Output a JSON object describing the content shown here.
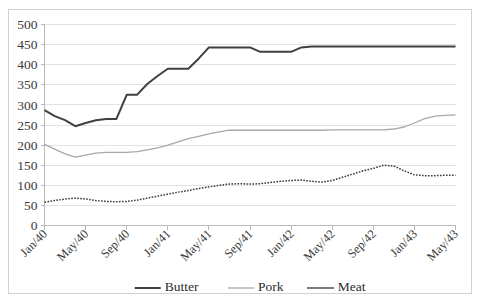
{
  "chart_data": {
    "type": "line",
    "title": "",
    "xlabel": "",
    "ylabel": "",
    "ylim": [
      0,
      500
    ],
    "ytick_step": 50,
    "ytick_labels": [
      "0",
      "50",
      "100",
      "150",
      "200",
      "250",
      "300",
      "350",
      "400",
      "450",
      "500"
    ],
    "grid": true,
    "legend_position": "bottom",
    "x_tick_labels": [
      "Jan/40",
      "May/40",
      "Sep/40",
      "Jan/41",
      "May/41",
      "Sep/41",
      "Jan/42",
      "May/42",
      "Sep/42",
      "Jan/43",
      "May/43"
    ],
    "x_tick_interval_months": 4,
    "x": [
      "Jan/40",
      "Feb/40",
      "Mar/40",
      "Apr/40",
      "May/40",
      "Jun/40",
      "Jul/40",
      "Aug/40",
      "Sep/40",
      "Oct/40",
      "Nov/40",
      "Dec/40",
      "Jan/41",
      "Feb/41",
      "Mar/41",
      "Apr/41",
      "May/41",
      "Jun/41",
      "Jul/41",
      "Aug/41",
      "Sep/41",
      "Oct/41",
      "Nov/41",
      "Dec/41",
      "Jan/42",
      "Feb/42",
      "Mar/42",
      "Apr/42",
      "May/42",
      "Jun/42",
      "Jul/42",
      "Aug/42",
      "Sep/42",
      "Oct/42",
      "Nov/42",
      "Dec/42",
      "Jan/43",
      "Feb/43",
      "Mar/43",
      "Apr/43",
      "May/43"
    ],
    "series": [
      {
        "name": "Butter",
        "color": "#404040",
        "width": 2.0,
        "style": "solid",
        "values": [
          287,
          272,
          262,
          247,
          255,
          262,
          265,
          265,
          325,
          325,
          352,
          372,
          390,
          390,
          390,
          415,
          443,
          443,
          443,
          443,
          443,
          432,
          432,
          432,
          432,
          443,
          445,
          445,
          445,
          445,
          445,
          445,
          445,
          445,
          445,
          445,
          445,
          445,
          445,
          445,
          445
        ]
      },
      {
        "name": "Pork",
        "color": "#a8a8a8",
        "width": 1.3,
        "style": "solid",
        "values": [
          202,
          190,
          178,
          170,
          175,
          180,
          182,
          182,
          182,
          184,
          188,
          193,
          200,
          208,
          216,
          222,
          228,
          233,
          237,
          237,
          237,
          237,
          237,
          237,
          237,
          237,
          237,
          237,
          238,
          238,
          238,
          238,
          238,
          238,
          240,
          245,
          255,
          266,
          272,
          274,
          275
        ]
      },
      {
        "name": "Meat",
        "color": "#3a3a3a",
        "width": 1.5,
        "style": "dotted",
        "values": [
          58,
          62,
          66,
          68,
          66,
          62,
          60,
          59,
          60,
          63,
          68,
          73,
          78,
          83,
          87,
          92,
          96,
          100,
          103,
          104,
          103,
          104,
          107,
          110,
          112,
          113,
          110,
          108,
          112,
          120,
          128,
          136,
          142,
          150,
          148,
          136,
          126,
          124,
          124,
          125,
          125
        ]
      }
    ]
  },
  "legend": {
    "items": [
      {
        "label": "Butter",
        "color": "#404040",
        "style": "solid",
        "width": 2.0
      },
      {
        "label": "Pork",
        "color": "#a8a8a8",
        "style": "solid",
        "width": 1.3
      },
      {
        "label": "Meat",
        "color": "#3a3a3a",
        "style": "dotted",
        "width": 1.5
      }
    ]
  }
}
